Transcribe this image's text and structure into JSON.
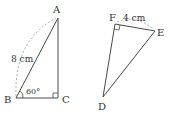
{
  "diagram": {
    "triangle1": {
      "vertices": {
        "A": "A",
        "B": "B",
        "C": "C"
      },
      "side_label": "8 cm",
      "angle_label": "60°",
      "right_angle_at": "C"
    },
    "triangle2": {
      "vertices": {
        "D": "D",
        "E": "E",
        "F": "F"
      },
      "side_label": "4 cm",
      "right_angle_at": "F"
    },
    "colors": {
      "stroke": "#4a4a4a",
      "dashed": "#9a9a9a",
      "text": "#333333"
    }
  }
}
